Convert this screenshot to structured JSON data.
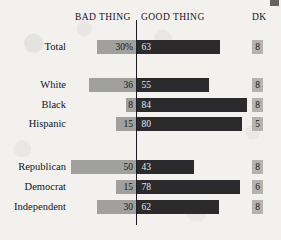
{
  "chart_data": {
    "type": "bar",
    "subtype": "diverging-stacked-bar",
    "title": "",
    "xlabel": "",
    "ylabel": "",
    "grid": false,
    "legend_position": "top",
    "columns": [
      "BAD THING",
      "GOOD THING",
      "DK"
    ],
    "categories": [
      "Total",
      "White",
      "Black",
      "Hispanic",
      "Republican",
      "Democrat",
      "Independent"
    ],
    "series": [
      {
        "name": "BAD THING",
        "values": [
          30,
          36,
          8,
          15,
          50,
          15,
          30
        ]
      },
      {
        "name": "GOOD THING",
        "values": [
          63,
          55,
          84,
          80,
          43,
          78,
          62
        ]
      },
      {
        "name": "DK",
        "values": [
          8,
          8,
          8,
          5,
          8,
          6,
          8
        ]
      }
    ],
    "value_labels": {
      "bad": [
        "30%",
        "36",
        "8",
        "15",
        "50",
        "15",
        "30"
      ],
      "good": [
        "63",
        "55",
        "84",
        "80",
        "43",
        "78",
        "62"
      ],
      "dk": [
        "8",
        "8",
        "8",
        "5",
        "8",
        "6",
        "8"
      ]
    },
    "colors": {
      "bad_thing_bar": "#a0a09c",
      "good_thing_bar": "#2b2b2e",
      "dk_box": "#b4b3ae",
      "divider": "#1b1b24",
      "background": "#f2f1ee",
      "text": "#13131c",
      "value_text_on_dark": "#e8e7e2"
    }
  },
  "header": {
    "bad_thing": "BAD THING",
    "good_thing": "GOOD THING",
    "dk": "DK"
  },
  "rows": [
    {
      "label": "Total",
      "bad": 30,
      "good": 63,
      "dk": "8",
      "bad_label": "30%",
      "good_label": "63",
      "group": 0
    },
    {
      "label": "White",
      "bad": 36,
      "good": 55,
      "dk": "8",
      "bad_label": "36",
      "good_label": "55",
      "group": 1
    },
    {
      "label": "Black",
      "bad": 8,
      "good": 84,
      "dk": "8",
      "bad_label": "8",
      "good_label": "84",
      "group": 1
    },
    {
      "label": "Hispanic",
      "bad": 15,
      "good": 80,
      "dk": "5",
      "bad_label": "15",
      "good_label": "80",
      "group": 1
    },
    {
      "label": "Republican",
      "bad": 50,
      "good": 43,
      "dk": "8",
      "bad_label": "50",
      "good_label": "43",
      "group": 2
    },
    {
      "label": "Democrat",
      "bad": 15,
      "good": 78,
      "dk": "6",
      "bad_label": "15",
      "good_label": "78",
      "group": 2
    },
    {
      "label": "Independent",
      "bad": 30,
      "good": 62,
      "dk": "8",
      "bad_label": "30",
      "good_label": "62",
      "group": 2
    }
  ],
  "layout": {
    "center_x": 136,
    "px_per_unit": 1.31,
    "row_tops": [
      40,
      78,
      98,
      117,
      160,
      180,
      200
    ]
  }
}
